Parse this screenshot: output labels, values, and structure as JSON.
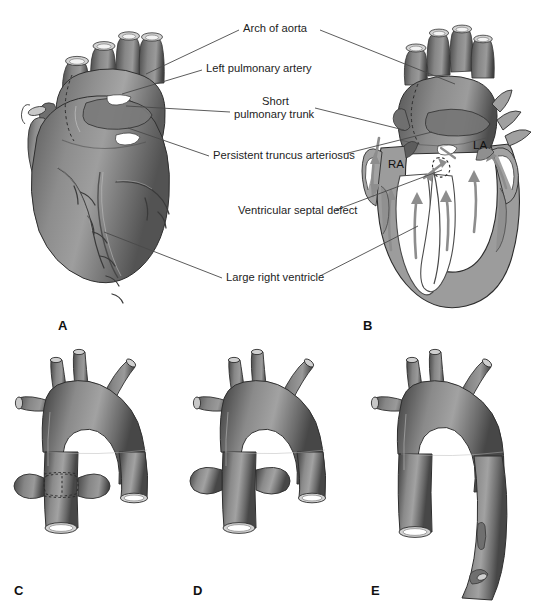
{
  "figure": {
    "title": "Persistent truncus arteriosus",
    "background_color": "#ffffff",
    "ink_color": "#1d1d1d"
  },
  "labels": [
    {
      "id": "arch-of-aorta",
      "text": "Arch of aorta",
      "x": 243,
      "y": 28
    },
    {
      "id": "left-pulmonary-artery",
      "text": "Left pulmonary artery",
      "x": 206,
      "y": 68
    },
    {
      "id": "short-pulmonary-trunk-line1",
      "text": "Short",
      "x": 262,
      "y": 101
    },
    {
      "id": "short-pulmonary-trunk-line2",
      "text": "pulmonary trunk",
      "x": 234,
      "y": 114
    },
    {
      "id": "persistent-truncus-arteriosus",
      "text": "Persistent truncus arteriosus",
      "x": 213,
      "y": 155
    },
    {
      "id": "ventricular-septal-defect",
      "text": "Ventricular septal defect",
      "x": 238,
      "y": 210
    },
    {
      "id": "large-right-ventricle",
      "text": "Large right ventricle",
      "x": 226,
      "y": 277
    }
  ],
  "chamber_labels": [
    {
      "id": "right-atrium",
      "text": "RA",
      "x": 388,
      "y": 164
    },
    {
      "id": "left-atrium",
      "text": "LA",
      "x": 473,
      "y": 145
    }
  ],
  "panels": [
    {
      "id": "panel-a",
      "letter": "A",
      "x": 58,
      "y": 318,
      "caption": "External view of heart with persistent truncus arteriosus"
    },
    {
      "id": "panel-b",
      "letter": "B",
      "x": 363,
      "y": 318,
      "caption": "Coronal cutaway showing ventricular septal defect and blood flow"
    },
    {
      "id": "panel-c",
      "letter": "C",
      "x": 14,
      "y": 583,
      "caption": "Type I truncus: short pulmonary trunk from truncus"
    },
    {
      "id": "panel-d",
      "letter": "D",
      "x": 193,
      "y": 583,
      "caption": "Type II truncus: pulmonary arteries arise separately"
    },
    {
      "id": "panel-e",
      "letter": "E",
      "x": 371,
      "y": 583,
      "caption": "Type III truncus: pulmonary arteries absent, bronchial supply"
    }
  ],
  "colors": {
    "vessel_dark": "#4f4f4f",
    "vessel_mid": "#7d7d7d",
    "vessel_light": "#a8a8a8",
    "heart_dark": "#5d5d5d",
    "heart_mid": "#8a8a8a",
    "heart_light": "#b4b4b4",
    "wall_gray": "#9a9a9a",
    "lumen_white": "#ffffff",
    "arrow_gray": "#8f8f8f",
    "outline": "#2b2b2b"
  }
}
